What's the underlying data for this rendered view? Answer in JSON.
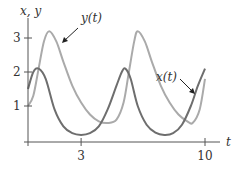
{
  "chart_data": {
    "type": "line",
    "title": "",
    "xlabel": "t",
    "ylabel": "x, y",
    "xlim": [
      0,
      10.8
    ],
    "ylim": [
      0,
      3.4
    ],
    "xticks": [
      3,
      10
    ],
    "xtick_labels": [
      "3",
      "10"
    ],
    "yticks": [
      1,
      2,
      3
    ],
    "ytick_labels": [
      "1",
      "2",
      "3"
    ],
    "grid": false,
    "annotations": [
      {
        "text": "y(t)",
        "points_to": "light curve first peak descending side"
      },
      {
        "text": "x(t)",
        "points_to": "dark curve near t=10"
      }
    ],
    "series": [
      {
        "name": "x(t)",
        "color": "#6e6e6e",
        "x": [
          0,
          0.3,
          0.6,
          1.0,
          1.5,
          2.0,
          2.5,
          3.0,
          3.5,
          4.0,
          4.5,
          5.0,
          5.3,
          5.5,
          5.8,
          6.2,
          6.7,
          7.2,
          7.7,
          8.2,
          8.7,
          9.2,
          9.6,
          10.0
        ],
        "values": [
          1.5,
          2.0,
          2.1,
          1.8,
          0.9,
          0.4,
          0.2,
          0.15,
          0.2,
          0.4,
          0.9,
          1.6,
          2.0,
          2.1,
          1.8,
          1.0,
          0.45,
          0.22,
          0.15,
          0.2,
          0.45,
          1.0,
          1.6,
          2.1
        ]
      },
      {
        "name": "y(t)",
        "color": "#aaaaaa",
        "x": [
          0,
          0.3,
          0.6,
          0.9,
          1.2,
          1.6,
          2.0,
          2.5,
          3.0,
          3.5,
          4.0,
          4.5,
          5.0,
          5.4,
          5.7,
          6.0,
          6.2,
          6.6,
          7.0,
          7.5,
          8.0,
          8.5,
          9.0,
          9.3,
          9.7,
          10.0
        ],
        "values": [
          1.0,
          1.3,
          2.1,
          2.9,
          3.2,
          2.9,
          2.3,
          1.6,
          1.1,
          0.75,
          0.55,
          0.5,
          0.6,
          1.1,
          2.0,
          2.9,
          3.2,
          2.9,
          2.3,
          1.6,
          1.1,
          0.75,
          0.55,
          0.5,
          0.9,
          1.8
        ]
      }
    ]
  },
  "labels": {
    "y_axis": "x, y",
    "x_axis": "t",
    "y_curve": "y(t)",
    "x_curve": "x(t)"
  }
}
